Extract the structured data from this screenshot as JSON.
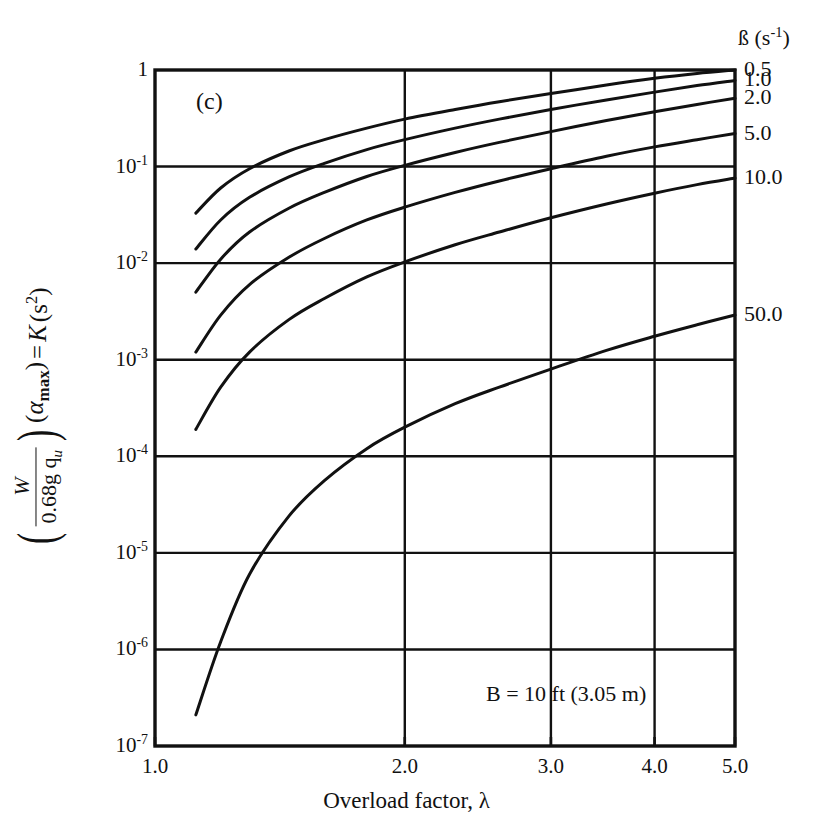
{
  "figure": {
    "panel_tag": "(c)",
    "annotation": "B  =  10 ft (3.05 m)"
  },
  "axes": {
    "x": {
      "label": "Overload factor, λ",
      "ticks": [
        "1.0",
        "2.0",
        "3.0",
        "4.0",
        "5.0"
      ],
      "tick_values": [
        1.0,
        2.0,
        3.0,
        4.0,
        5.0
      ],
      "min": 1.0,
      "max": 5.0,
      "scale": "log"
    },
    "y": {
      "label_parts": {
        "numerator": "W",
        "denominator": "0.68g  q",
        "denominator_sub": "u",
        "factor": "α",
        "factor_sub": "max",
        "equals": "=",
        "symbol": "K",
        "units": "(s",
        "units_sup": "2",
        "units_close": ")"
      },
      "ticks": [
        {
          "base": "1",
          "exp": ""
        },
        {
          "base": "10",
          "exp": "-1"
        },
        {
          "base": "10",
          "exp": "-2"
        },
        {
          "base": "10",
          "exp": "-3"
        },
        {
          "base": "10",
          "exp": "-4"
        },
        {
          "base": "10",
          "exp": "-5"
        },
        {
          "base": "10",
          "exp": "-6"
        },
        {
          "base": "10",
          "exp": "-7"
        }
      ],
      "tick_values": [
        1,
        0.1,
        0.01,
        0.001,
        0.0001,
        1e-05,
        1e-06,
        1e-07
      ],
      "min": 1e-07,
      "max": 1,
      "scale": "log"
    }
  },
  "legend": {
    "header": "ß (s",
    "header_sup": "-1",
    "header_close": ")",
    "position": "right-outside",
    "items": [
      "0.5",
      "1.0",
      "2.0",
      "5.0",
      "10.0",
      "50.0"
    ]
  },
  "style": {
    "line_color": "#111111",
    "frame_color": "#111111",
    "grid_color": "#111111",
    "background": "#ffffff"
  },
  "chart_data": {
    "type": "line",
    "title": "",
    "subtitle": "(c)",
    "xlabel": "Overload factor, λ",
    "ylabel": "(W / 0.68g q_u)(α_max) = K  (s²)",
    "xscale": "log",
    "yscale": "log",
    "xlim": [
      1.0,
      5.0
    ],
    "ylim": [
      1e-07,
      1
    ],
    "grid": true,
    "annotation": "B = 10 ft (3.05 m)",
    "legend_title": "ß (s⁻¹)",
    "series": [
      {
        "name": "0.5",
        "x": [
          1.12,
          1.2,
          1.3,
          1.45,
          1.6,
          1.8,
          2.0,
          2.3,
          2.6,
          3.0,
          3.5,
          4.0,
          4.5,
          5.0
        ],
        "y": [
          0.033,
          0.06,
          0.095,
          0.145,
          0.19,
          0.25,
          0.31,
          0.39,
          0.47,
          0.57,
          0.7,
          0.82,
          0.92,
          1.0
        ]
      },
      {
        "name": "1.0",
        "x": [
          1.12,
          1.2,
          1.3,
          1.45,
          1.6,
          1.8,
          2.0,
          2.3,
          2.6,
          3.0,
          3.5,
          4.0,
          4.5,
          5.0
        ],
        "y": [
          0.014,
          0.028,
          0.048,
          0.078,
          0.108,
          0.15,
          0.19,
          0.25,
          0.31,
          0.39,
          0.49,
          0.59,
          0.69,
          0.78
        ]
      },
      {
        "name": "2.0",
        "x": [
          1.12,
          1.2,
          1.3,
          1.45,
          1.6,
          1.8,
          2.0,
          2.3,
          2.6,
          3.0,
          3.5,
          4.0,
          4.5,
          5.0
        ],
        "y": [
          0.005,
          0.011,
          0.021,
          0.037,
          0.054,
          0.079,
          0.103,
          0.14,
          0.178,
          0.23,
          0.3,
          0.37,
          0.44,
          0.51
        ]
      },
      {
        "name": "5.0",
        "x": [
          1.12,
          1.2,
          1.3,
          1.45,
          1.6,
          1.8,
          2.0,
          2.3,
          2.6,
          3.0,
          3.5,
          4.0,
          4.5,
          5.0
        ],
        "y": [
          0.0012,
          0.0029,
          0.006,
          0.0115,
          0.018,
          0.028,
          0.038,
          0.054,
          0.071,
          0.095,
          0.128,
          0.16,
          0.19,
          0.22
        ]
      },
      {
        "name": "10.0",
        "x": [
          1.12,
          1.2,
          1.3,
          1.45,
          1.6,
          1.8,
          2.0,
          2.3,
          2.6,
          3.0,
          3.5,
          4.0,
          4.5,
          5.0
        ],
        "y": [
          0.00019,
          0.00052,
          0.0012,
          0.0026,
          0.0043,
          0.0072,
          0.0103,
          0.0155,
          0.021,
          0.0295,
          0.041,
          0.053,
          0.065,
          0.076
        ]
      },
      {
        "name": "50.0",
        "x": [
          1.12,
          1.2,
          1.3,
          1.45,
          1.6,
          1.8,
          2.0,
          2.3,
          2.6,
          3.0,
          3.5,
          4.0,
          4.5,
          5.0
        ],
        "y": [
          2.1e-07,
          1.2e-06,
          6e-06,
          2.4e-05,
          5.6e-05,
          0.00012,
          0.0002,
          0.00035,
          0.00052,
          0.0008,
          0.00125,
          0.00175,
          0.0023,
          0.0029
        ]
      }
    ]
  },
  "plot_geometry": {
    "left": 155,
    "right": 735,
    "top": 70,
    "bottom": 746
  }
}
